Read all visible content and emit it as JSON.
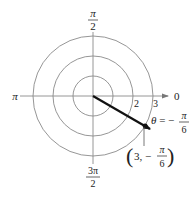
{
  "diagram": {
    "type": "polar-grid",
    "center": {
      "x": 93,
      "y": 96
    },
    "circles": [
      {
        "r_value": 1,
        "radius_px": 20
      },
      {
        "r_value": 2,
        "radius_px": 40
      },
      {
        "r_value": 3,
        "radius_px": 60
      }
    ],
    "axis_labels": {
      "angle_0": "0",
      "angle_pi": "π",
      "angle_pi_over_2_num": "π",
      "angle_pi_over_2_den": "2",
      "angle_3pi_over_2_num": "3π",
      "angle_3pi_over_2_den": "2"
    },
    "radius_labels": {
      "r2": "2",
      "r3": "3"
    },
    "point": {
      "r": 3,
      "theta": "-π/6",
      "label_open": "(3, −",
      "label_num": "π",
      "label_den": "6",
      "label_close": ")"
    },
    "angle_annotation": {
      "prefix": "θ = −",
      "num": "π",
      "den": "6"
    },
    "colors": {
      "grid": "#8a8a8a",
      "ray": "#111111",
      "text": "#222222"
    }
  }
}
